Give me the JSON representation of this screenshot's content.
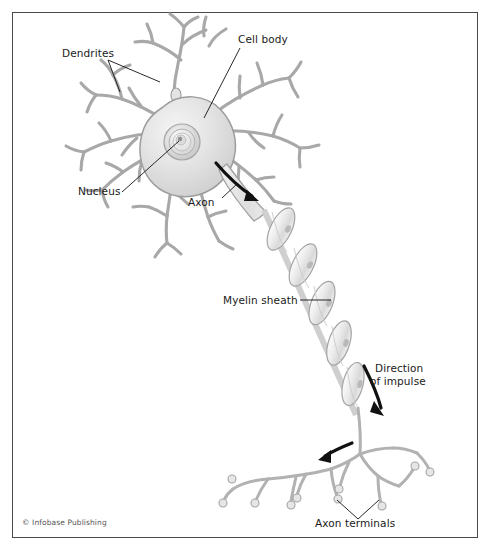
{
  "figure": {
    "background_color": "#ffffff",
    "frame_color": "#4a4a4a",
    "ink_color": "#1a1a1a",
    "cell_fill_light": "#ececec",
    "cell_fill_mid": "#dcdcdc",
    "cell_fill_dark": "#c4c4c4",
    "outline_color": "#9a9a9a",
    "arrow_color": "#111111"
  },
  "labels": {
    "dendrites": "Dendrites",
    "cell_body": "Cell body",
    "nucleus": "Nucleus",
    "axon": "Axon",
    "myelin_sheath": "Myelin sheath",
    "direction_line1": "Direction",
    "direction_line2": "of impulse",
    "axon_terminals": "Axon terminals"
  },
  "credit": "© Infobase Publishing",
  "icons": {
    "impulse_arrow": "curved-arrow-icon",
    "leader_line": "leader-line-icon"
  }
}
